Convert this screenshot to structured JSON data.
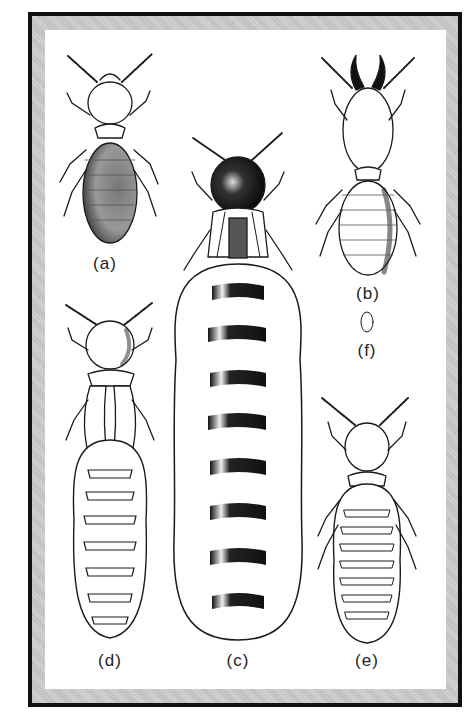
{
  "figure": {
    "frame_color": "#111111",
    "mat_color": "#c9c9c9",
    "panel_color": "#ffffff",
    "ink_color": "#1a1a1a"
  },
  "specimens": [
    {
      "id": "a",
      "label": "(a)",
      "description": "worker termite with stippled abdomen"
    },
    {
      "id": "b",
      "label": "(b)",
      "description": "soldier termite with large mandibles"
    },
    {
      "id": "c",
      "label": "(c)",
      "description": "queen with dark head and greatly enlarged banded abdomen"
    },
    {
      "id": "d",
      "label": "(d)",
      "description": "nymph / alate with wing pads and segmented abdomen"
    },
    {
      "id": "e",
      "label": "(e)",
      "description": "young nymph with segmented abdomen"
    },
    {
      "id": "f",
      "label": "(f)",
      "description": "egg"
    }
  ]
}
